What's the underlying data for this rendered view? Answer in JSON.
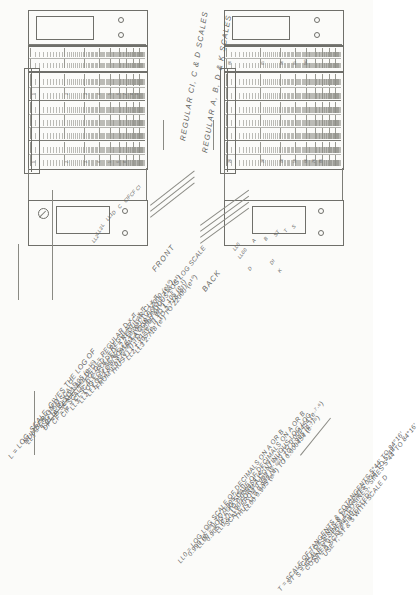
{
  "figure": {
    "captions": {
      "front": "FRONT",
      "back": "BACK",
      "front_scales": "REGULAR CI, C & D SCALES",
      "back_scales": "REGULAR A, B, D & K SCALES"
    }
  },
  "legend": {
    "lines": [
      {
        "id": "l0",
        "text": "L = LOG. SCALE, GIVES THE LOG OF",
        "indent": 0
      },
      {
        "id": "l1",
        "text": "NUMBER ON D",
        "indent": 1
      },
      {
        "id": "l2",
        "text": "LL1 = LOG LOG SCALE",
        "indent": 0
      },
      {
        "id": "l3",
        "text": "1.01 (e·¹⁰)    TO  1.105 (e·¹⁰)",
        "indent": 1
      },
      {
        "id": "l4",
        "text": "DF = D SCALE “FOLDED” = REGULAR D x π",
        "indent": 0
      },
      {
        "id": "l5",
        "text": "CF = C SCALE “FOLDED” = REGULAR C x π",
        "indent": 0
      },
      {
        "id": "l6",
        "text": "CIF = CI SCALE “FOLDED” = REGULAR CI x π",
        "indent": 0
      },
      {
        "id": "l7",
        "text": "LL3 = LOG LOG SCALE  2.718 (e¹) TO 22000 (e¹⁰)",
        "indent": 0
      },
      {
        "id": "l8",
        "text": "LL2 = LOG LOG SCALE  1.105 (e·¹) TO 2.718 (e¹)",
        "indent": 0
      },
      {
        "id": "l9",
        "text": "LL1, LL2 & LL3 FORM A CONTINUOUS LOG LOG SCALE",
        "indent": 0
      },
      {
        "id": "l10",
        "text": "FROM   1.01 (e·⁰¹)  TO  22000 (e¹⁰)",
        "indent": 0
      },
      {
        "id": "l11",
        "text": "THUS   LL1  1.01 (e·⁰¹)      TO 1.105 (e·¹)",
        "indent": 1
      },
      {
        "id": "l12",
        "text": "LL2  1.105 (e·¹)   TO 2.718 (e¹)",
        "indent": 2
      },
      {
        "id": "l13",
        "text": "LL3  2.718 (e¹)      TO 22000 (e¹⁰)",
        "indent": 2
      }
    ]
  },
  "legend2": {
    "lines": [
      {
        "id": "m0",
        "text": "LL0 = LOG LOG SCALE OF DECIMALS ON A OR B"
      },
      {
        "id": "m1",
        "text": "0.999 (e·⁰⁰¹)  TO   0.905 (e·¹)"
      },
      {
        "id": "m2",
        "text": "LL00 = LOG LOG SCALE OF DECIMALS ON A OR B"
      },
      {
        "id": "m3",
        "text": "0.905 (e·¹) TO 0.000454 (e·⁷·⁶)"
      },
      {
        "id": "m4",
        "text": "LL0 & LL00 FORM A CONTINUOUS LOG LOG"
      },
      {
        "id": "m5",
        "text": "SCALE FROM  0.999 (e·⁰⁰¹) TO 0.000454 (e·⁷·⁶)"
      },
      {
        "id": "m6",
        "text": "THUS  LL0  0.999 (e·⁰⁰¹)   TO  0.905 (e·¹)"
      },
      {
        "id": "m7",
        "text": "LL00  0.905 (e·¹)  TO 0.000454 (e·⁷·⁶)"
      }
    ]
  },
  "legend3": {
    "lines": [
      {
        "id": "n0",
        "text": "T = SCALE OF TANGENTS & COTANGENTS 5°44′ TO 84°16′"
      },
      {
        "id": "n1",
        "text": "ST = SCALE OF SINES & TANGENTS 0°34′ TO 5°44′"
      },
      {
        "id": "n2",
        "text": "S = SCALE OF SINES & COSINES, SINES 5°44′ TO 84°16′"
      },
      {
        "id": "n3",
        "text": "COSINES 0° TO 84°16′"
      },
      {
        "id": "n4",
        "text": "DI = D SCALE “INVERTED”"
      },
      {
        "id": "n5",
        "text": "USE T, ST & S WITH SCALE D"
      }
    ]
  },
  "front_scale_labels": [
    {
      "id": "f0",
      "text": "LL1"
    },
    {
      "id": "f1",
      "text": "D"
    },
    {
      "id": "f2",
      "text": "C"
    },
    {
      "id": "f3",
      "text": "CIF"
    },
    {
      "id": "f4",
      "text": "CF"
    },
    {
      "id": "f5",
      "text": "CI"
    },
    {
      "id": "f6",
      "text": "L"
    },
    {
      "id": "f7",
      "text": "LL3"
    },
    {
      "id": "f8",
      "text": "LL2"
    }
  ],
  "back_scale_labels": [
    {
      "id": "b0",
      "text": "LL0"
    },
    {
      "id": "b1",
      "text": "LL00"
    },
    {
      "id": "b2",
      "text": "A"
    },
    {
      "id": "b3",
      "text": "B"
    },
    {
      "id": "b4",
      "text": "ST"
    },
    {
      "id": "b5",
      "text": "T"
    },
    {
      "id": "b6",
      "text": "S"
    },
    {
      "id": "b7",
      "text": "DI"
    },
    {
      "id": "b8",
      "text": "K"
    },
    {
      "id": "b9",
      "text": "D"
    }
  ],
  "tick_numbers": {
    "front_upper": [
      "1",
      "2",
      "3",
      "4",
      "5",
      "6",
      "7",
      "8",
      "9"
    ],
    "front_lower": [
      "1",
      "2",
      "3",
      "4",
      "5",
      "6",
      "8"
    ],
    "back_upper": [
      "80",
      "85",
      "90",
      "95",
      "100"
    ],
    "back_values": [
      "1000",
      "2000",
      "5000",
      "10000",
      "20000"
    ],
    "back_lower": [
      "20",
      "30",
      "40",
      "50",
      "60",
      "70",
      "80"
    ]
  },
  "colors": {
    "ink": "#6f6f6a",
    "paper": "#fbfbf9",
    "hairline": "#8d8d88"
  }
}
